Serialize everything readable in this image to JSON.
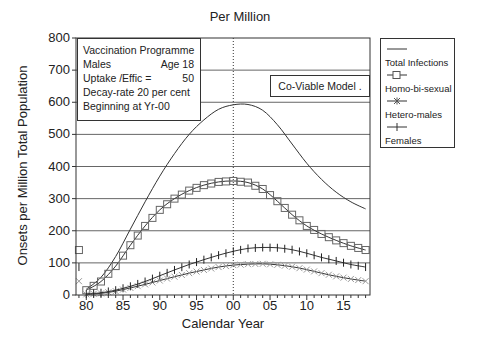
{
  "chart_data": {
    "type": "line",
    "title": "Per Million",
    "xlabel": "Calendar Year",
    "ylabel": "Onsets per Million Total Population",
    "ylim": [
      0,
      800
    ],
    "xlim": [
      1978.6,
      2018.6
    ],
    "grid": {
      "horizontal": true,
      "vertical": false
    },
    "vertical_marker": {
      "x": 2000,
      "style": "dotted",
      "label": "Yr-00"
    },
    "y_ticks": [
      "0",
      "100",
      "200",
      "300",
      "400",
      "500",
      "600",
      "700",
      "800"
    ],
    "x_tick_labels": [
      "80",
      "85",
      "90",
      "95",
      "00",
      "05",
      "10",
      "15"
    ],
    "x_tick_values": [
      1980,
      1985,
      1990,
      1995,
      2000,
      2005,
      2010,
      2015
    ],
    "legend_position": "right-outside",
    "x": [
      1980,
      1982,
      1984,
      1986,
      1988,
      1990,
      1992,
      1994,
      1996,
      1998,
      2000,
      2002,
      2004,
      2006,
      2008,
      2010,
      2012,
      2014,
      2016,
      2018
    ],
    "series": [
      {
        "name": "Total Infections",
        "marker": "none",
        "values": [
          18,
          55,
          120,
          205,
          290,
          370,
          440,
          500,
          545,
          578,
          592,
          593,
          575,
          530,
          470,
          410,
          360,
          320,
          290,
          268
        ]
      },
      {
        "name": "Homo-bi-sexual",
        "marker": "square",
        "values": [
          15,
          42,
          90,
          155,
          215,
          265,
          300,
          325,
          342,
          352,
          355,
          350,
          330,
          292,
          250,
          215,
          190,
          170,
          153,
          140
        ]
      },
      {
        "name": "Hetero-males",
        "marker": "asterisk",
        "values": [
          2,
          5,
          12,
          22,
          33,
          45,
          57,
          68,
          78,
          87,
          93,
          96,
          97,
          94,
          88,
          79,
          68,
          58,
          50,
          43
        ]
      },
      {
        "name": "Females",
        "marker": "plus",
        "values": [
          3,
          7,
          15,
          27,
          42,
          60,
          78,
          95,
          110,
          124,
          136,
          145,
          148,
          147,
          141,
          130,
          117,
          106,
          95,
          87
        ]
      }
    ],
    "annotations": [
      {
        "text": "Vaccination Programme"
      },
      {
        "text": "Males Age 18"
      },
      {
        "text": "Uptake /Effic = 50"
      },
      {
        "text": "Decay-rate 20 per cent"
      },
      {
        "text": "Beginning at Yr-00"
      },
      {
        "text": "Co-Viable Model ."
      }
    ]
  },
  "info_box": {
    "line1": "Vaccination Programme",
    "line2_left": "Males",
    "line2_right": "Age 18",
    "line3_left": "Uptake /Effic =",
    "line3_right": "50",
    "line4": "Decay-rate  20 per cent",
    "line5": "Beginning  at  Yr-00"
  },
  "model_label": "Co-Viable  Model .",
  "legend": {
    "items": [
      {
        "label": "Total Infections",
        "icon": "line-icon"
      },
      {
        "label": "Homo-bi-sexual",
        "icon": "square-marker-icon"
      },
      {
        "label": "Hetero-males",
        "icon": "asterisk-marker-icon"
      },
      {
        "label": "Females",
        "icon": "plus-marker-icon"
      }
    ]
  },
  "colors": {
    "line": "#333333",
    "grid": "#555555",
    "marker_fill": "#ffffff",
    "hetero_marker": "#888888"
  }
}
